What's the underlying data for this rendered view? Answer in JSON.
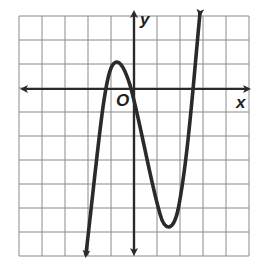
{
  "graph": {
    "axis_labels": {
      "x": "x",
      "y": "y",
      "origin": "O"
    },
    "grid": {
      "columns": 10,
      "rows": 10,
      "left": 19,
      "top": 16,
      "cell_w": 23,
      "cell_h": 24
    },
    "origin_px": [
      134,
      89
    ],
    "colors": {
      "grid": "#8a8a8a",
      "curve": "#2a2a2a",
      "axes": "#2a2a2a"
    },
    "curve": {
      "type": "cubic",
      "description": "Cubic function rising from lower left, local max near (-1,1), crosses origin, local min near (1.5,-6), rising to upper right",
      "points_px": [
        [
          86,
          256
        ],
        [
          100,
          140
        ],
        [
          108,
          80
        ],
        [
          114,
          63
        ],
        [
          122,
          70
        ],
        [
          134,
          96
        ],
        [
          150,
          170
        ],
        [
          162,
          218
        ],
        [
          169,
          228
        ],
        [
          177,
          218
        ],
        [
          188,
          150
        ],
        [
          196,
          60
        ],
        [
          200,
          13
        ]
      ]
    }
  }
}
